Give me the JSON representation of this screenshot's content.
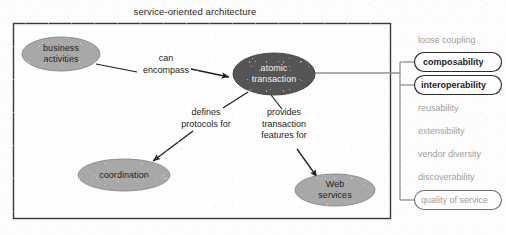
{
  "diagram": {
    "title": "service-oriented architecture",
    "frame": {
      "x": 13,
      "y": 23,
      "w": 377,
      "h": 195,
      "border_color": "#3a3a3a",
      "fill": "#fefefe"
    }
  },
  "nodes": [
    {
      "id": "business-activities",
      "label_lines": [
        "business",
        "activities"
      ],
      "shape": "ellipse",
      "fill": "#a8a8a8",
      "stroke": "#8d8d8d",
      "text_color": "#1c1c1c",
      "cx": 61,
      "cy": 54,
      "rx": 39,
      "ry": 17
    },
    {
      "id": "atomic-transaction",
      "label_lines": [
        "atomic",
        "transaction"
      ],
      "shape": "ellipse",
      "fill": "#555555",
      "stroke": "#4a4a4a",
      "text_color": "#f2f2f2",
      "cx": 274,
      "cy": 74,
      "rx": 41,
      "ry": 21
    },
    {
      "id": "coordination",
      "label_lines": [
        "coordination"
      ],
      "shape": "ellipse",
      "fill": "#a8a8a8",
      "stroke": "#8d8d8d",
      "text_color": "#1c1c1c",
      "cx": 124,
      "cy": 175,
      "rx": 46,
      "ry": 16
    },
    {
      "id": "web-services",
      "label_lines": [
        "Web",
        "services"
      ],
      "shape": "ellipse",
      "fill": "#a8a8a8",
      "stroke": "#8d8d8d",
      "text_color": "#1c1c1c",
      "cx": 335,
      "cy": 190,
      "rx": 40,
      "ry": 16
    }
  ],
  "edges": [
    {
      "id": "can-encompass",
      "from": "business-activities",
      "to": "atomic-transaction",
      "label_lines": [
        "can",
        "encompass"
      ],
      "label_x": 166,
      "label_y": 53
    },
    {
      "id": "defines-protocols-for",
      "from": "atomic-transaction",
      "to": "coordination",
      "label_lines": [
        "defines",
        "protocols for"
      ],
      "label_x": 206,
      "label_y": 113
    },
    {
      "id": "provides-transaction-features-for",
      "from": "atomic-transaction",
      "to": "web-services",
      "label_lines": [
        "provides",
        "transaction",
        "features for"
      ],
      "label_x": 284,
      "label_y": 117
    }
  ],
  "quality_list": {
    "trunk_color": "#8f8f8f",
    "items": [
      {
        "label": "loose coupling",
        "boxed": false,
        "emphasis": "light",
        "y": 40
      },
      {
        "label": "composability",
        "boxed": true,
        "emphasis": "strong",
        "y": 62
      },
      {
        "label": "interoperability",
        "boxed": true,
        "emphasis": "strong",
        "y": 85
      },
      {
        "label": "reusability",
        "boxed": false,
        "emphasis": "light",
        "y": 108
      },
      {
        "label": "extensibility",
        "boxed": false,
        "emphasis": "light",
        "y": 131
      },
      {
        "label": "vendor diversity",
        "boxed": false,
        "emphasis": "light",
        "y": 154
      },
      {
        "label": "discoverability",
        "boxed": false,
        "emphasis": "light",
        "y": 177
      },
      {
        "label": "quality of service",
        "boxed": true,
        "emphasis": "light",
        "y": 200
      }
    ]
  },
  "colors": {
    "node_light": "#a8a8a8",
    "node_dark": "#555555",
    "frame_border": "#3a3a3a",
    "line": "#2b2b2b",
    "list_text_muted": "#9d9d9d",
    "list_text_strong": "#1b1b1b",
    "background": "#fdfdfd"
  }
}
